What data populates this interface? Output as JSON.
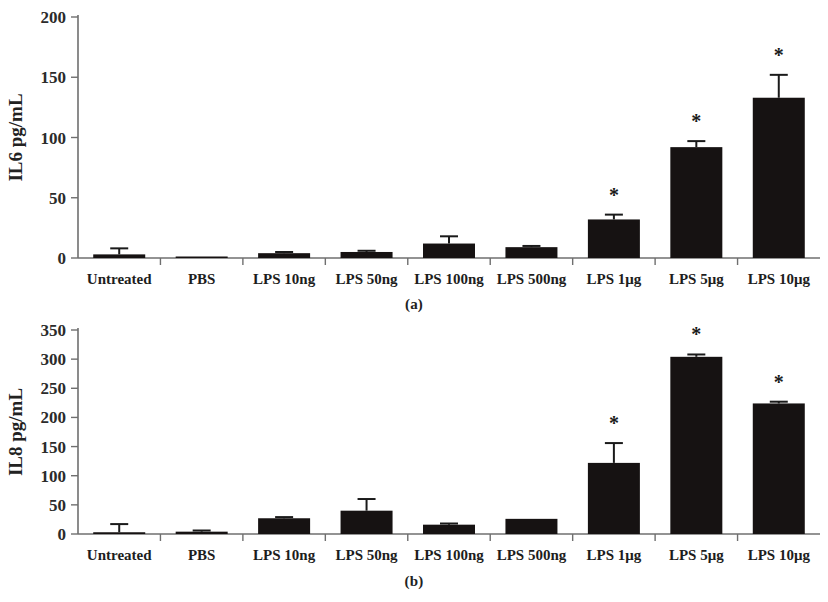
{
  "figure": {
    "caption_a": "(a)",
    "caption_b": "(b)"
  },
  "chart_data": [
    {
      "type": "bar",
      "panel": "a",
      "title": "",
      "xlabel": "",
      "ylabel": "IL6 pg/mL",
      "ylim": [
        0,
        200
      ],
      "yticks": [
        0,
        50,
        100,
        150,
        200
      ],
      "ytick_labels": [
        "0",
        "50",
        "100",
        "150",
        "200"
      ],
      "grid": false,
      "legend": "none",
      "categories": [
        "Untreated",
        "PBS",
        "LPS 10ng",
        "LPS 50ng",
        "LPS 100ng",
        "LPS 500ng",
        "LPS 1μg",
        "LPS 5μg",
        "LPS 10μg"
      ],
      "values": [
        3,
        1,
        4,
        5,
        12,
        9,
        32,
        92,
        133
      ],
      "errors": [
        5,
        0,
        1,
        1,
        6,
        1,
        4,
        5,
        19
      ],
      "significance": [
        "",
        "",
        "",
        "",
        "",
        "",
        "*",
        "*",
        "*"
      ]
    },
    {
      "type": "bar",
      "panel": "b",
      "title": "",
      "xlabel": "",
      "ylabel": "IL8 pg/mL",
      "ylim": [
        0,
        350
      ],
      "yticks": [
        0,
        50,
        100,
        150,
        200,
        250,
        300,
        350
      ],
      "ytick_labels": [
        "0",
        "50",
        "100",
        "150",
        "200",
        "250",
        "300",
        "350"
      ],
      "grid": false,
      "legend": "none",
      "categories": [
        "Untreated",
        "PBS",
        "LPS 10ng",
        "LPS 50ng",
        "LPS 100ng",
        "LPS 500ng",
        "LPS 1μg",
        "LPS 5μg",
        "LPS 10μg"
      ],
      "values": [
        3,
        4,
        27,
        40,
        16,
        26,
        122,
        304,
        224
      ],
      "errors": [
        14,
        2,
        2,
        20,
        2,
        0,
        34,
        4,
        3
      ],
      "significance": [
        "",
        "",
        "",
        "",
        "",
        "",
        "*",
        "*",
        "*"
      ]
    }
  ],
  "colors": {
    "bar": "#161212",
    "axis": "#6f6f6f",
    "text": "#1a1a1a",
    "background": "#ffffff"
  }
}
